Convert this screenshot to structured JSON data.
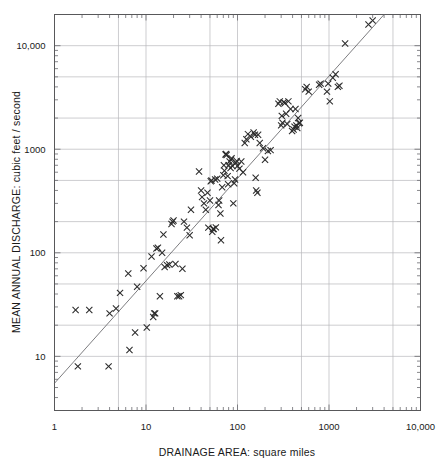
{
  "chart_data": {
    "type": "scatter",
    "title": "",
    "subtitle": "",
    "xlabel": "DRAINAGE AREA:  square miles",
    "ylabel": "MEAN ANNUAL DISCHARGE:  cubic feet / second",
    "xscale": "log",
    "yscale": "log",
    "xlim": [
      1,
      10000
    ],
    "ylim": [
      3,
      20000
    ],
    "grid": true,
    "legend": null,
    "legend_position": "none",
    "marker_symbol": "x",
    "marker_color": "#2b2b2b",
    "line_color": "#6e6e72",
    "grid_color": "#b8b8bc",
    "frame_color": "#58585a",
    "xticks_major": [
      1,
      10,
      100,
      1000,
      10000
    ],
    "xtick_labels": [
      "1",
      "10",
      "100",
      "1000",
      "10,000"
    ],
    "yticks_major": [
      10,
      100,
      1000,
      10000
    ],
    "ytick_labels": [
      "10",
      "100",
      "1000",
      "10,000"
    ],
    "xgridlines": [
      1,
      5,
      10,
      50,
      100,
      500,
      1000,
      5000,
      10000
    ],
    "ygridlines": [
      10,
      20,
      50,
      100,
      200,
      500,
      1000,
      2000,
      5000,
      10000
    ],
    "trendline": {
      "label": "fitted power-law regression",
      "x": [
        1,
        4000
      ],
      "y": [
        5.5,
        20000
      ],
      "equation_form": "Q = a * A^b",
      "slope_loglog": 1.0,
      "intercept_at_x1": 5.5
    },
    "points": [
      [
        1.7,
        28
      ],
      [
        1.8,
        8.0
      ],
      [
        2.4,
        28
      ],
      [
        3.9,
        8.0
      ],
      [
        4.0,
        26
      ],
      [
        4.7,
        29
      ],
      [
        5.2,
        41
      ],
      [
        6.4,
        63
      ],
      [
        6.6,
        11.5
      ],
      [
        7.6,
        17
      ],
      [
        8.0,
        47
      ],
      [
        9.4,
        71
      ],
      [
        10.2,
        19
      ],
      [
        11.5,
        92
      ],
      [
        12.0,
        24
      ],
      [
        12.3,
        26
      ],
      [
        12.6,
        26
      ],
      [
        13.0,
        110
      ],
      [
        13.5,
        112
      ],
      [
        14.2,
        38
      ],
      [
        15.0,
        100
      ],
      [
        15.5,
        150
      ],
      [
        16.0,
        73
      ],
      [
        17.0,
        76
      ],
      [
        18.0,
        77
      ],
      [
        19.0,
        190
      ],
      [
        19.5,
        200
      ],
      [
        20.0,
        205
      ],
      [
        21.0,
        78
      ],
      [
        22.0,
        38
      ],
      [
        23.0,
        38
      ],
      [
        24.0,
        39
      ],
      [
        25.0,
        70
      ],
      [
        26.0,
        200
      ],
      [
        28.0,
        175
      ],
      [
        30.0,
        148
      ],
      [
        31.0,
        260
      ],
      [
        38.0,
        610
      ],
      [
        40.0,
        400
      ],
      [
        41.0,
        345
      ],
      [
        43.0,
        300
      ],
      [
        45.0,
        260
      ],
      [
        47.0,
        380
      ],
      [
        48.0,
        175
      ],
      [
        50.0,
        320
      ],
      [
        51.0,
        490
      ],
      [
        52.0,
        500
      ],
      [
        53.0,
        160
      ],
      [
        54.0,
        170
      ],
      [
        55.0,
        170
      ],
      [
        57.0,
        510
      ],
      [
        58.0,
        176
      ],
      [
        60.0,
        520
      ],
      [
        62.0,
        290
      ],
      [
        63.0,
        320
      ],
      [
        65.0,
        240
      ],
      [
        66.0,
        132
      ],
      [
        68.0,
        430
      ],
      [
        70.0,
        560
      ],
      [
        71.0,
        700
      ],
      [
        72.0,
        620
      ],
      [
        74.0,
        890
      ],
      [
        75.0,
        900
      ],
      [
        76.0,
        880
      ],
      [
        78.0,
        550
      ],
      [
        79.0,
        460
      ],
      [
        80.0,
        700
      ],
      [
        82.0,
        760
      ],
      [
        84.0,
        660
      ],
      [
        85.0,
        790
      ],
      [
        86.0,
        820
      ],
      [
        88.0,
        690
      ],
      [
        90.0,
        300
      ],
      [
        92.0,
        470
      ],
      [
        94.0,
        510
      ],
      [
        96.0,
        740
      ],
      [
        98.0,
        770
      ],
      [
        100.0,
        690
      ],
      [
        105.0,
        650
      ],
      [
        110.0,
        760
      ],
      [
        115.0,
        600
      ],
      [
        120.0,
        1150
      ],
      [
        125.0,
        1250
      ],
      [
        130.0,
        1400
      ],
      [
        140.0,
        1320
      ],
      [
        150.0,
        1450
      ],
      [
        155.0,
        1380
      ],
      [
        158.0,
        530
      ],
      [
        160.0,
        400
      ],
      [
        165.0,
        380
      ],
      [
        168.0,
        1380
      ],
      [
        175.0,
        1150
      ],
      [
        190.0,
        1020
      ],
      [
        200.0,
        790
      ],
      [
        215.0,
        960
      ],
      [
        230.0,
        980
      ],
      [
        280.0,
        2750
      ],
      [
        290.0,
        2900
      ],
      [
        300.0,
        1700
      ],
      [
        305.0,
        2100
      ],
      [
        310.0,
        1800
      ],
      [
        320.0,
        2850
      ],
      [
        330.0,
        2800
      ],
      [
        340.0,
        2200
      ],
      [
        350.0,
        1750
      ],
      [
        360.0,
        2900
      ],
      [
        380.0,
        2450
      ],
      [
        395.0,
        1500
      ],
      [
        410.0,
        1550
      ],
      [
        420.0,
        1650
      ],
      [
        430.0,
        2450
      ],
      [
        440.0,
        1700
      ],
      [
        450.0,
        1600
      ],
      [
        460.0,
        2000
      ],
      [
        470.0,
        1780
      ],
      [
        480.0,
        1800
      ],
      [
        550.0,
        3800
      ],
      [
        570.0,
        4000
      ],
      [
        600.0,
        3600
      ],
      [
        780.0,
        4200
      ],
      [
        810.0,
        4300
      ],
      [
        950.0,
        3600
      ],
      [
        980.0,
        4300
      ],
      [
        1020.0,
        2900
      ],
      [
        1100.0,
        4900
      ],
      [
        1180.0,
        5300
      ],
      [
        1250.0,
        4000
      ],
      [
        1300.0,
        4100
      ],
      [
        1500.0,
        10500
      ],
      [
        2700.0,
        16000
      ],
      [
        3000.0,
        17500
      ]
    ]
  }
}
